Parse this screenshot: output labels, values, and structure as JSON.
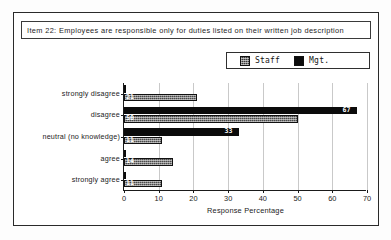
{
  "figure": {
    "title": "Item 22:  Employees are responsible only for duties listed on their written job description"
  },
  "legend": {
    "position": "top-right",
    "entries": [
      {
        "label": "Staff",
        "swatch": "staff-hatched-swatch",
        "color": "#4a4a4a"
      },
      {
        "label": "Mgt.",
        "swatch": "mgt-solid-swatch",
        "color": "#0b0b0b"
      }
    ]
  },
  "chart_data": {
    "type": "bar",
    "orientation": "horizontal",
    "title": "Item 22:  Employees are responsible only for duties listed on their written job description",
    "xlabel": "Response Percentage",
    "ylabel": "",
    "xlim": [
      0,
      70
    ],
    "xticks": [
      0,
      10,
      20,
      30,
      40,
      50,
      60,
      70
    ],
    "grid": "vertical",
    "categories": [
      "strongly disagree",
      "disagree",
      "neutral (no knowledge)",
      "agree",
      "strongly agree"
    ],
    "series": [
      {
        "name": "Staff",
        "values": [
          21,
          50,
          11,
          14,
          11
        ]
      },
      {
        "name": "Mgt.",
        "values": [
          0,
          67,
          33,
          0,
          0
        ]
      }
    ],
    "value_labels": {
      "Staff": [
        "21",
        "50",
        "11",
        "14",
        "11"
      ],
      "Mgt.": [
        "",
        "67",
        "33",
        "",
        ""
      ]
    }
  }
}
